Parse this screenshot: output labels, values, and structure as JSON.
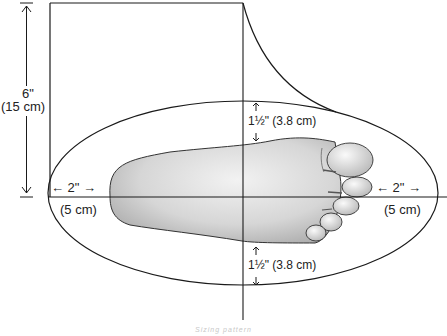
{
  "diagram": {
    "type": "foot-measurement-pattern",
    "height_label": {
      "imperial": "6\"",
      "metric": "(15 cm)"
    },
    "top_margin_label": {
      "imperial": "1½\"",
      "metric": "(3.8 cm)",
      "full": "1½\" (3.8 cm)"
    },
    "bottom_margin_label": {
      "imperial": "1½\"",
      "metric": "(3.8 cm)",
      "full": "1½\" (3.8 cm)"
    },
    "heel_margin_label": {
      "imperial": "← 2\" →",
      "metric": "(5 cm)"
    },
    "toe_margin_label": {
      "imperial": "← 2\" →",
      "metric": "(5 cm)"
    },
    "caption": "Sizing pattern"
  },
  "colors": {
    "line": "#1a1a1a",
    "foot_fill": "#d8d8d8",
    "foot_shadow": "#a8a8a8",
    "caption": "#c8c8c8"
  }
}
